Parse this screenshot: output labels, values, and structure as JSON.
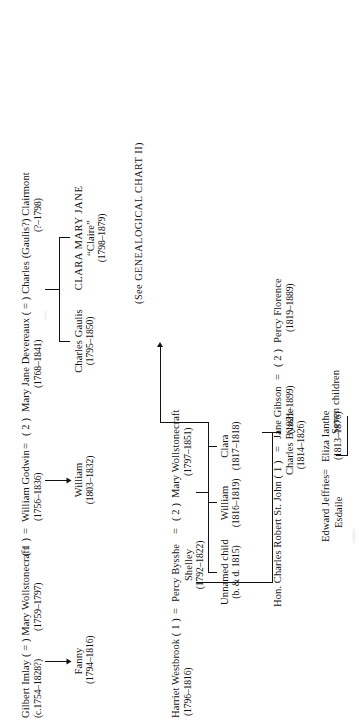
{
  "chart": {
    "title_note": "(See GENEALOGICAL CHART II)",
    "generation1": {
      "imlay": {
        "name": "Gilbert Imlay ( = ) Mary Wollstonecraft",
        "dates_left": "(c.1754–1828?)",
        "dates_right": "(1759–1797)"
      },
      "godwin": {
        "name": "( 1 )  =  William Godwin  =  ( 2 )  Mary Jane Devereaux ( = ) Charles (Gaulis?) Clairmont",
        "godwin_dates": "(1756–1836)",
        "devereaux_dates": "(1768–1841)",
        "clairmont_dates": "(?–1798)"
      },
      "imlay_label": "Gilbert Imlay ( = ) Mary Wollstonecraft",
      "imlay_dates_a": "(c.1754–1828?)",
      "imlay_dates_b": "(1759–1797)",
      "godwin_marriage_1": "( 1 )",
      "godwin_eq_1": "=",
      "godwin_name": "William Godwin",
      "godwin_dates": "(1756–1836)",
      "godwin_eq_2": "=",
      "godwin_marriage_2": "( 2 )",
      "devereaux_name": "Mary Jane Devereaux ( = ) Charles (Gaulis?) Clairmont",
      "devereaux_dates": "(1768–1841)",
      "clairmont_dates": "(?–1798)"
    },
    "generation2": {
      "fanny": {
        "name": "Fanny",
        "dates": "(1794–1816)"
      },
      "william_godwin_jr": {
        "name": "William",
        "dates": "(1803–1832)"
      },
      "charles_gaulis": {
        "name": "Charles Gaulis",
        "dates": "(1795–1850)"
      },
      "clara_mary_jane": {
        "name": "CLARA MARY JANE",
        "nickname": "“Claire”",
        "dates": "(1798–1879)"
      },
      "shelley_line": {
        "harriet": "Harriet Westbrook ( 1 )",
        "eq_1": "=",
        "percy": "Percy Bysshe",
        "percy_surname": "Shelley",
        "percy_dates": "(1792–1822)",
        "eq_2": "=",
        "marriage_2": "( 2 )",
        "mary": "Mary Wollstonecraft",
        "mary_dates": "(1797–1851)",
        "harriet_dates": "(1796–1816)"
      }
    },
    "generation3": {
      "unnamed_child": {
        "name": "Unnamed child",
        "dates": "(b. & d. 1815)"
      },
      "william_shelley": {
        "name": "William",
        "dates": "(1816–1819)"
      },
      "clara_shelley": {
        "name": "Clara",
        "dates": "(1817–1818)"
      },
      "percy_florence": {
        "name": "Percy Florence",
        "dates": "(1819–1889)"
      },
      "charles_bysshe": {
        "name": "Charles Bysshe",
        "dates": "(1814–1826)"
      },
      "eliza_ianthe": {
        "name": "Eliza Ianthe",
        "dates": "(1813–1876)"
      },
      "st_john_line": {
        "hon_charles": "Hon. Charles Robert St. John ( 1 )",
        "eq_1": "=",
        "jane": "Jane Gibson",
        "jane_dates": "(1821–1899)",
        "eq_2": "=",
        "marriage_2": "( 2 )",
        "percy": "Percy Florence",
        "percy_dates": "(1819–1889)"
      },
      "esdaile_line": {
        "edward": "Edward Jeffries",
        "edward_surname": "Esdaile",
        "eq": "=",
        "eliza": "Eliza Ianthe",
        "eliza_dates": "(1813–1876)"
      }
    },
    "generation4": {
      "seven_children": "Seven children"
    }
  },
  "colors": {
    "ink": "#111111",
    "paper": "#ffffff"
  }
}
